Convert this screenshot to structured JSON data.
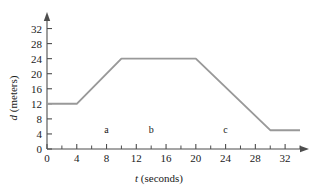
{
  "chart_data": {
    "type": "line",
    "title": "",
    "subtitle": "",
    "xlabel_symbol": "t",
    "xlabel_unit": "(seconds)",
    "ylabel_symbol": "d",
    "ylabel_unit": "(meters)",
    "xlim": [
      0,
      34
    ],
    "ylim": [
      0,
      34
    ],
    "xticks": [
      0,
      4,
      8,
      12,
      16,
      20,
      24,
      28,
      32
    ],
    "yticks": [
      0,
      4,
      8,
      12,
      16,
      20,
      24,
      28,
      32
    ],
    "xtick_labels": [
      "0",
      "4",
      "8",
      "12",
      "16",
      "20",
      "24",
      "28",
      "32"
    ],
    "ytick_labels": [
      "0",
      "4",
      "8",
      "12",
      "16",
      "20",
      "24",
      "28",
      "32"
    ],
    "x_minor_tick_step": 2,
    "grid": false,
    "legend": null,
    "series": [
      {
        "name": "distance",
        "color": "#999999",
        "x": [
          0,
          4,
          10,
          20,
          30,
          34
        ],
        "y": [
          12,
          12,
          24,
          24,
          5,
          5
        ]
      }
    ],
    "annotations": [
      {
        "label": "a",
        "x": 8,
        "y": 4
      },
      {
        "label": "b",
        "x": 14,
        "y": 4
      },
      {
        "label": "c",
        "x": 24,
        "y": 4
      }
    ],
    "axis_color": "#4d4d4d",
    "text_color": "#1a1a1a",
    "background": "#ffffff"
  }
}
